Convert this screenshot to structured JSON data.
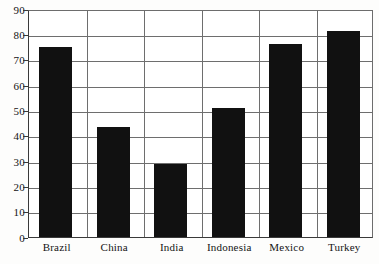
{
  "chart_data": {
    "type": "bar",
    "title": "",
    "subtitle": "",
    "xlabel": "",
    "ylabel": "",
    "categories": [
      "Brazil",
      "China",
      "India",
      "Indonesia",
      "Mexico",
      "Turkey"
    ],
    "values": [
      75,
      43.5,
      29,
      51,
      76,
      81.5
    ],
    "series": [
      {
        "name": "value",
        "values": [
          75,
          43.5,
          29,
          51,
          76,
          81.5
        ]
      }
    ],
    "ylim": [
      0,
      90
    ],
    "ytick_labels": [
      "0",
      "10",
      "20",
      "30",
      "40",
      "50",
      "60",
      "70",
      "80",
      "90"
    ],
    "ytick_values": [
      0,
      10,
      20,
      30,
      40,
      50,
      60,
      70,
      80,
      90
    ],
    "grid": true,
    "grid_orientation": "horizontal",
    "legend": false,
    "legend_position": "none",
    "annotations": [],
    "colors": {
      "bar": "#111111",
      "grid": "#6e6e6e",
      "axis": "#3a3a3a",
      "background": "#ffffff",
      "text": "#141414"
    }
  }
}
